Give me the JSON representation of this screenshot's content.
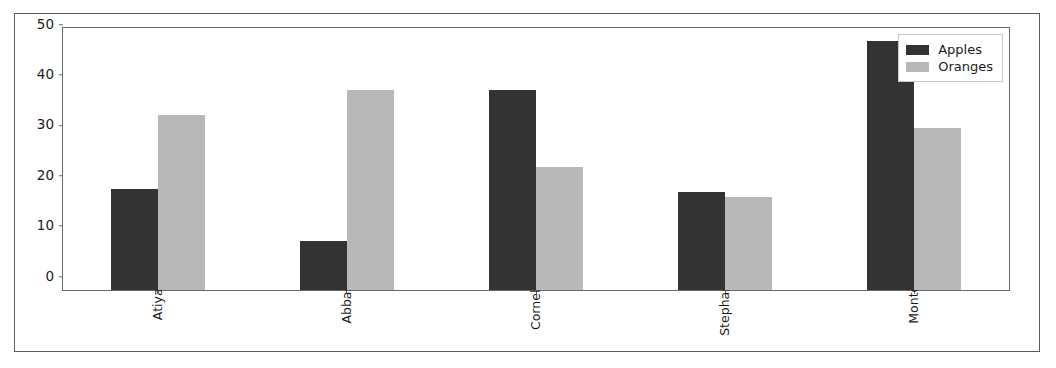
{
  "chart_data": {
    "type": "bar",
    "title": "",
    "xlabel": "",
    "ylabel": "",
    "categories": [
      "Atiya",
      "Abbas",
      "Cornelia",
      "Stephanie",
      "Monte"
    ],
    "series": [
      {
        "name": "Apples",
        "color": "#333333",
        "values": [
          20.0,
          9.7,
          39.7,
          19.5,
          49.5
        ]
      },
      {
        "name": "Oranges",
        "color": "#b8b8b8",
        "values": [
          34.7,
          39.7,
          24.5,
          18.4,
          32.2
        ]
      }
    ],
    "yticks": [
      0,
      10,
      20,
      30,
      40,
      50
    ],
    "ylim": [
      0,
      52
    ],
    "grid": false,
    "legend_position": "upper right",
    "xtick_rotation": 90
  },
  "legend": {
    "entries": [
      {
        "label": "Apples"
      },
      {
        "label": "Oranges"
      }
    ]
  },
  "style": {
    "figure_border_color": "#5d5d5d",
    "axes_border_color": "#6a6a6a",
    "background": "#ffffff",
    "text_color": "#1a1a1a"
  }
}
